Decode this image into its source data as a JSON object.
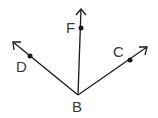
{
  "diagram": {
    "type": "geometry-rays",
    "vertex": {
      "label": "B",
      "x": 78,
      "y": 95
    },
    "rays": [
      {
        "name": "BD",
        "point_label": "D",
        "point": {
          "x": 30,
          "y": 56
        },
        "tip": {
          "x": 13,
          "y": 42
        },
        "label_pos": {
          "x": 17,
          "y": 71
        }
      },
      {
        "name": "BF",
        "point_label": "F",
        "point": {
          "x": 81,
          "y": 28
        },
        "tip": {
          "x": 81,
          "y": 9
        },
        "label_pos": {
          "x": 67,
          "y": 33
        }
      },
      {
        "name": "BC",
        "point_label": "C",
        "point": {
          "x": 130,
          "y": 60
        },
        "tip": {
          "x": 147,
          "y": 47
        },
        "label_pos": {
          "x": 114,
          "y": 57
        }
      }
    ],
    "colors": {
      "line": "#1a1a1a",
      "text": "#3a3a3a"
    }
  },
  "labels": {
    "B": "B",
    "D": "D",
    "F": "F",
    "C": "C"
  }
}
